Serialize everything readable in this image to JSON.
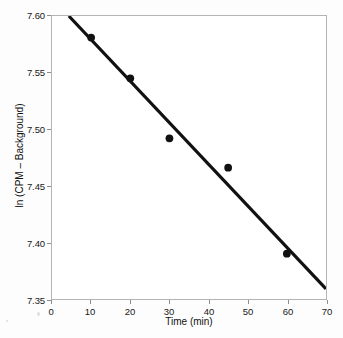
{
  "chart_data": {
    "type": "scatter",
    "title": "",
    "xlabel": "Time (min)",
    "ylabel": "ln (CPM – Background)",
    "xlim": [
      0,
      70
    ],
    "ylim": [
      7.35,
      7.6
    ],
    "xticks": [
      0,
      10,
      20,
      30,
      40,
      50,
      60,
      70
    ],
    "xtick_labels": [
      "0",
      "10",
      "20",
      "30",
      "40",
      "50",
      "60",
      "70"
    ],
    "yticks": [
      7.35,
      7.4,
      7.45,
      7.5,
      7.55,
      7.6
    ],
    "ytick_labels": [
      "7.35",
      "7.40",
      "7.45",
      "7.50",
      "7.55",
      "7.60"
    ],
    "grid": false,
    "legend": "none",
    "series": [
      {
        "name": "measured",
        "marker": "filled-circle",
        "color": "#111111",
        "x": [
          10,
          20,
          30,
          45,
          60
        ],
        "y": [
          7.581,
          7.545,
          7.492,
          7.466,
          7.39
        ]
      },
      {
        "name": "linear-fit",
        "type": "line",
        "color": "#111111",
        "x": [
          4.3,
          70
        ],
        "y": [
          7.6,
          7.359
        ]
      }
    ]
  },
  "axes": {
    "x_title": "Time (min)",
    "y_title": "ln (CPM – Background)"
  }
}
